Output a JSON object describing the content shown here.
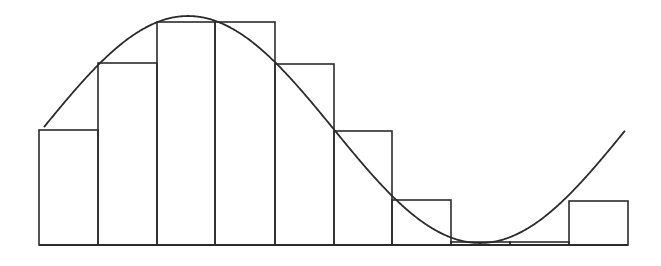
{
  "figure": {
    "stroke_color": "#2b2b2b",
    "background": "#ffffff"
  },
  "chart_data": {
    "type": "bar",
    "title": "",
    "xlabel": "",
    "ylabel": "",
    "categories": [
      "1",
      "2",
      "3",
      "4",
      "5",
      "6",
      "7",
      "8",
      "9",
      "10"
    ],
    "values": [
      1.01,
      1.6,
      1.96,
      1.96,
      1.59,
      1.0,
      0.4,
      0.03,
      0.03,
      0.39
    ],
    "curve": {
      "function": "1 + sin(x)",
      "x_start": 0,
      "x_end": 6.28,
      "description": "one full period of a shifted sine wave overlaid on the rectangles"
    },
    "ylim": [
      0,
      2
    ],
    "grid": false,
    "legend": null
  },
  "layout": {
    "baseline_y": 245,
    "bar_edges_x": [
      39,
      98,
      157,
      215,
      275,
      334,
      392,
      451,
      510,
      569,
      628
    ],
    "bar_tops_y": [
      130,
      63,
      22,
      22,
      64,
      131,
      200,
      242,
      242,
      201
    ],
    "curve": {
      "x0": 44,
      "x1": 625,
      "center_y": 129.5,
      "amplitude": 113.5,
      "phase_x": 42,
      "half_period": 292
    }
  }
}
